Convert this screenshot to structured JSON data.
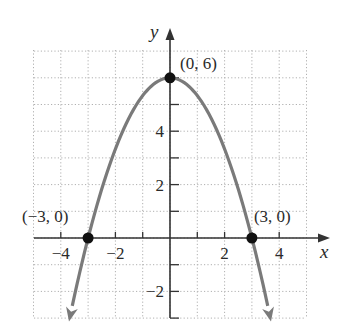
{
  "chart_data": {
    "type": "line",
    "title": "",
    "xlabel": "x",
    "ylabel": "y",
    "xlim": [
      -4.9,
      5.1
    ],
    "ylim": [
      -3.0,
      6.9
    ],
    "grid": true,
    "grid_style": "dotted",
    "x_ticks": [
      -4,
      -3,
      -2,
      -1,
      1,
      2,
      3,
      4
    ],
    "y_ticks": [
      -3,
      -2,
      -1,
      1,
      2,
      3,
      4,
      5,
      6
    ],
    "x_tick_labels": [
      {
        "value": -4,
        "text": "−4"
      },
      {
        "value": -2,
        "text": "−2"
      },
      {
        "value": 2,
        "text": "2"
      },
      {
        "value": 4,
        "text": "4"
      }
    ],
    "y_tick_labels": [
      {
        "value": 4,
        "text": "4"
      },
      {
        "value": 2,
        "text": "2"
      },
      {
        "value": -2,
        "text": "−2"
      }
    ],
    "series": [
      {
        "name": "parabola",
        "equation": "y = 6 - (2/3)x^2",
        "color": "#7a7a7a",
        "x": [
          -3.7,
          -3.0,
          -2.0,
          -1.0,
          0.0,
          1.0,
          2.0,
          3.0,
          3.7
        ],
        "y": [
          -3.13,
          0.0,
          3.33,
          5.33,
          6.0,
          5.33,
          3.33,
          0.0,
          -3.13
        ],
        "arrows_at_ends": true
      }
    ],
    "points": [
      {
        "x": -3,
        "y": 0,
        "label": "(−3, 0)"
      },
      {
        "x": 0,
        "y": 6,
        "label": "(0, 6)"
      },
      {
        "x": 3,
        "y": 0,
        "label": "(3, 0)"
      }
    ],
    "annotations": [
      "(−3, 0)",
      "(0, 6)",
      "(3, 0)"
    ]
  },
  "axes": {
    "x_label": "x",
    "y_label": "y"
  },
  "colors": {
    "curve": "#7a7a7a",
    "axis": "#333333",
    "grid": "#b0b0b0",
    "point": "#111111"
  }
}
